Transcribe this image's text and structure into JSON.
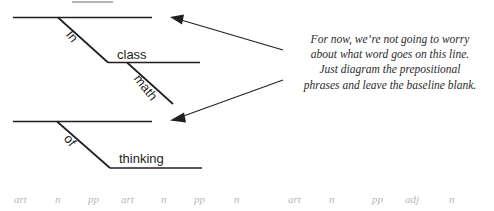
{
  "figure": {
    "name": "prepositional-phrase-sentence-diagram",
    "ink_color": "#231f20",
    "note_color": "#2b2b2b",
    "legend_color": "#b8b8bd"
  },
  "diagram": {
    "top": {
      "words": [
        {
          "id": "in",
          "text": "In",
          "orientation": "slanted"
        },
        {
          "id": "class",
          "text": "class",
          "orientation": "horizontal"
        },
        {
          "id": "math",
          "text": "math",
          "orientation": "slanted"
        }
      ]
    },
    "bottom": {
      "words": [
        {
          "id": "of",
          "text": "of",
          "orientation": "slanted"
        },
        {
          "id": "thinking",
          "text": "thinking",
          "orientation": "horizontal"
        }
      ]
    }
  },
  "annotation": {
    "lines": [
      "For now, we’re not going to worry",
      "about what word goes on this line.",
      "Just diagram the prepositional",
      "phrases and leave the baseline blank."
    ]
  },
  "legend": {
    "tags": [
      {
        "label": "art",
        "x": 14
      },
      {
        "label": "n",
        "x": 55
      },
      {
        "label": "pp",
        "x": 88
      },
      {
        "label": "art",
        "x": 121
      },
      {
        "label": "n",
        "x": 161
      },
      {
        "label": "pp",
        "x": 194
      },
      {
        "label": "n",
        "x": 234
      },
      {
        "label": "art",
        "x": 288
      },
      {
        "label": "n",
        "x": 329
      },
      {
        "label": "pp",
        "x": 372
      },
      {
        "label": "adj",
        "x": 405
      },
      {
        "label": "n",
        "x": 449
      }
    ]
  }
}
